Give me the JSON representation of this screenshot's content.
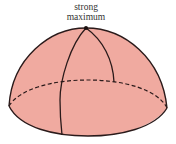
{
  "diagram": {
    "shape": "hemisphere",
    "label_lines": [
      "strong",
      "maximum"
    ],
    "colors": {
      "fill": "#f0aaa0",
      "stroke": "#2a1a1a",
      "text": "#333333",
      "background": "#ffffff"
    }
  }
}
